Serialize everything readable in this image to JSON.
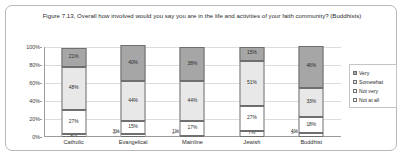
{
  "chart_data": {
    "type": "bar",
    "subtype": "stacked-100-percent",
    "title": "Figure 7.13, Overall how involved would you say you are in the life and activities of your faith community? (Buddhists)",
    "xlabel": "",
    "ylabel": "",
    "ylim": [
      0,
      100
    ],
    "ytick_labels": [
      "100%",
      "80%",
      "60%",
      "40%",
      "20%",
      "0%"
    ],
    "ytick_values": [
      100,
      80,
      60,
      40,
      20,
      0
    ],
    "grid": true,
    "legend_position": "right",
    "categories": [
      "Catholic",
      "Evangelical",
      "Mainline",
      "Jewish",
      "Buddhist"
    ],
    "series": [
      {
        "name": "Very",
        "color": "#a6a6a6",
        "values": [
          21,
          40,
          38,
          15,
          46
        ],
        "labels": [
          "21%",
          "40%",
          "38%",
          "15%",
          "46%"
        ]
      },
      {
        "name": "Somewhat",
        "color": "#e8e8e8",
        "values": [
          48,
          44,
          44,
          51,
          33
        ],
        "labels": [
          "48%",
          "44%",
          "44%",
          "51%",
          "33%"
        ]
      },
      {
        "name": "Not very",
        "color": "#ffffff",
        "values": [
          27,
          15,
          17,
          27,
          18
        ],
        "labels": [
          "27%",
          "15%",
          "17%",
          "27%",
          "18%"
        ]
      },
      {
        "name": "Not at all",
        "color": "#ffffff",
        "values": [
          3,
          3,
          1,
          7,
          4
        ],
        "labels": [
          "3%",
          "3%",
          "1%",
          "7%",
          "4%"
        ]
      }
    ],
    "callouts": [
      {
        "category": "Evangelical",
        "series": "Not at all",
        "label": "3%"
      },
      {
        "category": "Mainline",
        "series": "Not at all",
        "label": "1%"
      },
      {
        "category": "Buddhist",
        "series": "Not at all",
        "label": "4%"
      }
    ]
  },
  "legend": {
    "items": [
      {
        "label": "Very"
      },
      {
        "label": "Somewhat"
      },
      {
        "label": "Not very"
      },
      {
        "label": "Not at all"
      }
    ]
  }
}
